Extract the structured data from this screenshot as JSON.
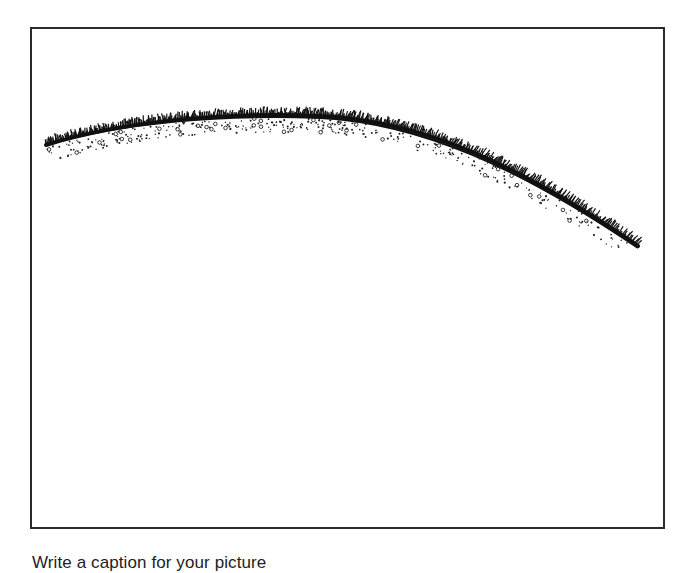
{
  "picture": {
    "subject": "grassy-hill-curve",
    "frame_border_color": "#2b2b2b",
    "ink_color": "#111111"
  },
  "caption": {
    "prompt": "Write a caption for your picture"
  }
}
